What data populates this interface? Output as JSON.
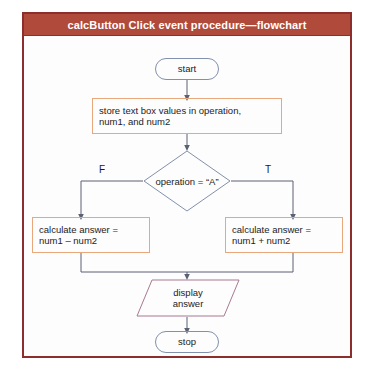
{
  "figure": {
    "title": "calcButton Click event procedure—flowchart",
    "frame_color": "#8c2f2c",
    "title_band_color": "#b04a3a",
    "title_text_color": "#ffffff",
    "canvas_color": "#fdfdfe"
  },
  "palette": {
    "terminal_border": "#8190ab",
    "process_border": "#e8a87c",
    "decision_border": "#8190ab",
    "output_border": "#a8798f",
    "connector": "#5a6172",
    "text": "#1c1c1c"
  },
  "nodes": {
    "start": {
      "label": "start",
      "shape": "terminal"
    },
    "store": {
      "line1": "store text box values in operation,",
      "line2": "num1, and num2",
      "shape": "process"
    },
    "decision": {
      "label": "operation = “A”",
      "shape": "decision"
    },
    "calc_false": {
      "line1": "calculate answer =",
      "line2": "num1 – num2",
      "shape": "process"
    },
    "calc_true": {
      "line1": "calculate answer =",
      "line2": "num1 + num2",
      "shape": "process"
    },
    "display": {
      "line1": "display",
      "line2": "answer",
      "shape": "output"
    },
    "stop": {
      "label": "stop",
      "shape": "terminal"
    }
  },
  "branches": {
    "false_label": "F",
    "true_label": "T"
  }
}
